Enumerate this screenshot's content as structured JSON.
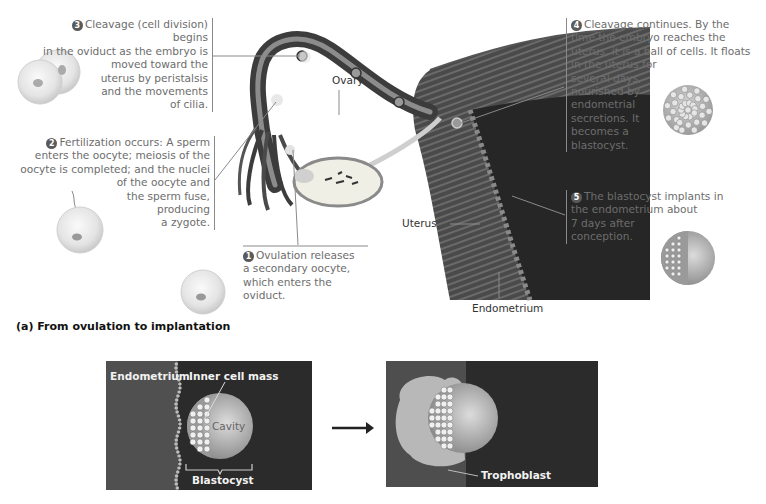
{
  "steps": [
    {
      "number": "1",
      "text": "Ovulation releases a secondary oocyte, which enters the oviduct."
    },
    {
      "number": "2",
      "text_lines": [
        "Fertilization occurs: A sperm",
        "enters the oocyte; meiosis of the",
        "oocyte is completed; and the nuclei",
        "of the oocyte and",
        "the sperm fuse,",
        "producing",
        "a zygote."
      ]
    },
    {
      "number": "3",
      "text_lines": [
        "Cleavage (cell division) begins",
        "in the oviduct as the embryo is",
        "moved toward the",
        "uterus by peristalsis",
        "and the movements",
        "of cilia."
      ]
    },
    {
      "number": "4",
      "text_lines": [
        "Cleavage continues. By the",
        "time the embryo reaches the",
        "uterus, it is a ball of cells. It floats",
        "in the uterus for",
        "several days,",
        "nourished by",
        "endometrial",
        "secretions. It",
        "becomes a",
        "blastocyst."
      ]
    },
    {
      "number": "5",
      "text_lines": [
        "The blastocyst implants in",
        "the endometrium about",
        "7 days after",
        "conception."
      ]
    }
  ],
  "step1_lines": [
    "Ovulation releases",
    "a secondary oocyte,",
    "which enters the",
    "oviduct."
  ],
  "labels": {
    "ovary": "Ovary",
    "uterus": "Uterus",
    "endometrium": "Endometrium"
  },
  "panel_a_title": "(a) From ovulation to implantation",
  "bottom_left": {
    "endometrium": "Endometrium",
    "inner_cell_mass": "Inner cell mass",
    "cavity": "Cavity",
    "blastocyst": "Blastocyst"
  },
  "bottom_right": {
    "trophoblast": "Trophoblast"
  },
  "colors": {
    "tissue_dark": "#3a3a3a",
    "panel_bg": "#2b2b2b",
    "caption_gray": "#6d6d6d"
  }
}
